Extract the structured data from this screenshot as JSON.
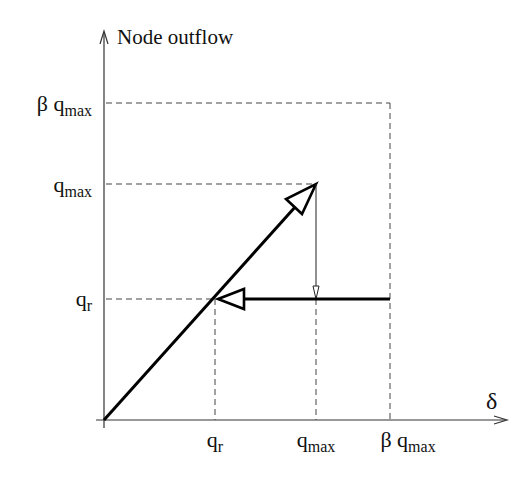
{
  "diagram": {
    "y_axis_label": "Node outflow",
    "x_axis_label": "δ",
    "y_ticks": [
      {
        "id": "beta_qmax",
        "base": "β q",
        "sub": "max"
      },
      {
        "id": "qmax",
        "base": "q",
        "sub": "max"
      },
      {
        "id": "qr",
        "base": "q",
        "sub": "r"
      }
    ],
    "x_ticks": [
      {
        "id": "qr",
        "base": "q",
        "sub": "r"
      },
      {
        "id": "qmax",
        "base": "q",
        "sub": "max"
      },
      {
        "id": "beta_qmax",
        "base": "β q",
        "sub": "max"
      }
    ],
    "colors": {
      "line": "#000000",
      "axis": "#333333",
      "background": "#ffffff"
    }
  }
}
